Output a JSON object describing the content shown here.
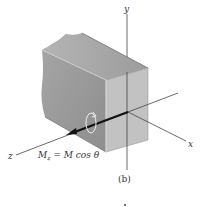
{
  "figure": {
    "caption": "(b)",
    "axes": {
      "x": "x",
      "y": "y",
      "z": "z"
    },
    "moment_label": {
      "lhs": "M",
      "sub": "z",
      "rhs": " = M cos θ"
    },
    "colors": {
      "block_front": "#bdbdbd",
      "block_side": "#9a9a9a",
      "block_top": "#a8a8a8",
      "axis": "#444444",
      "arrow": "#111111"
    }
  }
}
